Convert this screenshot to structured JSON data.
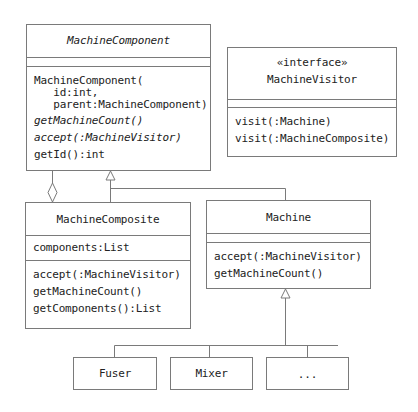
{
  "classes": {
    "machine_component": {
      "name": "MachineComponent",
      "name_italic": true,
      "attributes": [],
      "operations": [
        {
          "text": "MachineComponent(",
          "italic": false
        },
        {
          "text": "   id:int,",
          "italic": false
        },
        {
          "text": "   parent:MachineComponent)",
          "italic": false
        },
        {
          "text": "getMachineCount()",
          "italic": true
        },
        {
          "text": "accept(:MachineVisitor)",
          "italic": true
        },
        {
          "text": "getId():int",
          "italic": false
        }
      ]
    },
    "machine_visitor": {
      "stereotype": "«interface»",
      "name": "MachineVisitor",
      "attributes": [],
      "operations": [
        {
          "text": "visit(:Machine)"
        },
        {
          "text": "visit(:MachineComposite)"
        }
      ]
    },
    "machine_composite": {
      "name": "MachineComposite",
      "attributes": [
        {
          "text": "components:List"
        }
      ],
      "operations": [
        {
          "text": "accept(:MachineVisitor)"
        },
        {
          "text": "getMachineCount()"
        },
        {
          "text": "getComponents():List"
        }
      ]
    },
    "machine": {
      "name": "Machine",
      "attributes": [],
      "operations": [
        {
          "text": "accept(:MachineVisitor)"
        },
        {
          "text": "getMachineCount()"
        }
      ]
    },
    "fuser": {
      "name": "Fuser"
    },
    "mixer": {
      "name": "Mixer"
    },
    "ellipsis": {
      "name": "..."
    }
  },
  "relationships": [
    {
      "type": "aggregation",
      "from": "MachineComposite",
      "to": "MachineComponent"
    },
    {
      "type": "generalization",
      "from": "MachineComposite",
      "to": "MachineComponent"
    },
    {
      "type": "generalization",
      "from": "Machine",
      "to": "MachineComponent"
    },
    {
      "type": "generalization",
      "from": "Fuser",
      "to": "Machine"
    },
    {
      "type": "generalization",
      "from": "Mixer",
      "to": "Machine"
    },
    {
      "type": "generalization",
      "from": "...",
      "to": "Machine"
    }
  ],
  "colors": {
    "line": "#7a7a7a",
    "text": "#222222",
    "background": "#ffffff"
  }
}
